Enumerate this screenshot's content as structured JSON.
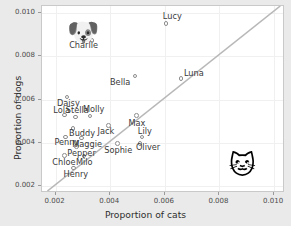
{
  "chart_data": {
    "type": "scatter",
    "title": "",
    "xlabel": "Proportion of cats",
    "ylabel": "Proportion of dogs",
    "xlim": [
      0.0015,
      0.0104
    ],
    "ylim": [
      0.0017,
      0.0103
    ],
    "xticks": [
      0.002,
      0.004,
      0.006,
      0.008,
      0.01
    ],
    "yticks": [
      0.002,
      0.004,
      0.006,
      0.008,
      0.01
    ],
    "xtick_labels": [
      "0.002",
      "0.004",
      "0.006",
      "0.008",
      "0.010"
    ],
    "ytick_labels": [
      "0.002",
      "0.004",
      "0.006",
      "0.008",
      "0.010"
    ],
    "grid": true,
    "legend": "none",
    "reference_line": {
      "name": "y-equals-x-diagonal",
      "type": "identity",
      "color": "#b8b8b8"
    },
    "point_color": "#8d8d8d",
    "points": [
      {
        "name": "Lucy",
        "x": 0.006,
        "y": 0.00955,
        "label_dx": -2,
        "label_dy": -10
      },
      {
        "name": "Charlie",
        "x": 0.0033,
        "y": 0.00875,
        "label_dx": -22,
        "label_dy": 1
      },
      {
        "name": "Luna",
        "x": 0.00655,
        "y": 0.007,
        "label_dx": 4,
        "label_dy": -9
      },
      {
        "name": "Bella",
        "x": 0.00487,
        "y": 0.00712,
        "label_dx": -24,
        "label_dy": 3
      },
      {
        "name": "Daisy",
        "x": 0.00238,
        "y": 0.00617,
        "label_dx": -9,
        "label_dy": 3
      },
      {
        "name": "Lola",
        "x": 0.00228,
        "y": 0.00533,
        "label_dx": -10,
        "label_dy": -8
      },
      {
        "name": "Stella",
        "x": 0.0027,
        "y": 0.00524,
        "label_dx": -9,
        "label_dy": -10
      },
      {
        "name": "Molly",
        "x": 0.00322,
        "y": 0.00528,
        "label_dx": -6,
        "label_dy": -10
      },
      {
        "name": "Jack",
        "x": 0.0039,
        "y": 0.00485,
        "label_dx": -10,
        "label_dy": 2
      },
      {
        "name": "Max",
        "x": 0.00492,
        "y": 0.0053,
        "label_dx": -7,
        "label_dy": 4
      },
      {
        "name": "Buddy",
        "x": 0.0026,
        "y": 0.00472,
        "label_dx": -3,
        "label_dy": 2
      },
      {
        "name": "Penny",
        "x": 0.00232,
        "y": 0.00432,
        "label_dx": -10,
        "label_dy": 2
      },
      {
        "name": "Maggie",
        "x": 0.0029,
        "y": 0.00428,
        "label_dx": -8,
        "label_dy": 3
      },
      {
        "name": "Lily",
        "x": 0.00512,
        "y": 0.00432,
        "label_dx": -3,
        "label_dy": -9
      },
      {
        "name": "Oliver",
        "x": 0.00505,
        "y": 0.00403,
        "label_dx": -3,
        "label_dy": 1
      },
      {
        "name": "Pepper",
        "x": 0.00272,
        "y": 0.00388,
        "label_dx": -8,
        "label_dy": 3
      },
      {
        "name": "Sophie",
        "x": 0.00422,
        "y": 0.00402,
        "label_dx": -12,
        "label_dy": 3
      },
      {
        "name": "Chloe",
        "x": 0.00228,
        "y": 0.00347,
        "label_dx": -11,
        "label_dy": 3
      },
      {
        "name": "Milo",
        "x": 0.003,
        "y": 0.00345,
        "label_dx": -7,
        "label_dy": 3
      },
      {
        "name": "Henry",
        "x": 0.00262,
        "y": 0.0029,
        "label_dx": -9,
        "label_dy": 3
      }
    ],
    "annotations": [
      {
        "name": "dog-face-emoji",
        "glyph": "🐶",
        "x": 0.0029,
        "y": 0.00905
      },
      {
        "name": "cat-face-emoji",
        "glyph": "🐱",
        "x": 0.00882,
        "y": 0.00292
      }
    ]
  }
}
